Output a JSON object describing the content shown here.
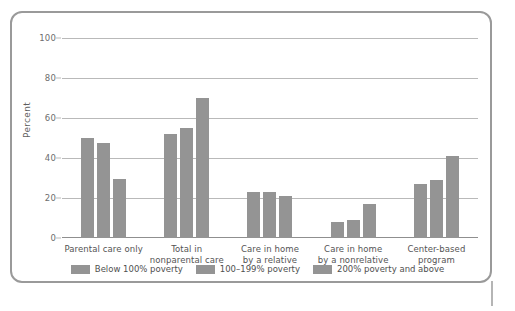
{
  "chart_data": {
    "type": "bar",
    "title": "",
    "subtitle": "",
    "xlabel": "",
    "ylabel": "Percent",
    "ylim": [
      0,
      100
    ],
    "yticks": [
      0,
      20,
      40,
      60,
      80,
      100
    ],
    "grid": true,
    "legend_position": "bottom",
    "categories": [
      "Parental care only",
      "Total in\nnonparental care",
      "Care in home\nby a relative",
      "Care in home\nby a nonrelative",
      "Center-based\nprogram"
    ],
    "series": [
      {
        "name": "Below 100% poverty",
        "color": "#949494",
        "values": [
          50,
          52,
          23,
          8,
          27
        ]
      },
      {
        "name": "100–199% poverty",
        "color": "#949494",
        "values": [
          47.5,
          55,
          23,
          9,
          29
        ]
      },
      {
        "name": "200% poverty and above",
        "color": "#949494",
        "values": [
          29.5,
          70,
          21,
          17,
          41
        ]
      }
    ]
  },
  "axis": {
    "y_title": "Percent",
    "y_tick_labels": [
      "100",
      "80",
      "60",
      "40",
      "20",
      "0"
    ],
    "x_tick_labels": [
      "Parental care only",
      "Total in\nnonparental care",
      "Care in home\nby a relative",
      "Care in home\nby a nonrelative",
      "Center-based\nprogram"
    ]
  },
  "legend": {
    "items": [
      {
        "label": "Below 100% poverty"
      },
      {
        "label": "100–199% poverty"
      },
      {
        "label": "200% poverty and above"
      }
    ]
  },
  "colors": {
    "bar": "#949494",
    "grid": "#b9b9b9",
    "frame": "#9a9a9a",
    "text": "#4f4f4f"
  }
}
